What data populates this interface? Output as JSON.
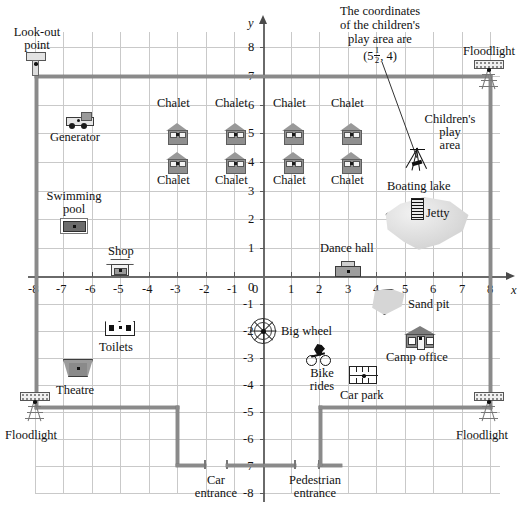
{
  "axes": {
    "x_name": "x",
    "y_name": "y",
    "x_ticks": [
      "-8",
      "-7",
      "-6",
      "-5",
      "-4",
      "-3",
      "-2",
      "-1",
      "0",
      "1",
      "2",
      "3",
      "4",
      "5",
      "6",
      "7",
      "8"
    ],
    "y_ticks": [
      "8",
      "7",
      "6",
      "5",
      "4",
      "3",
      "2",
      "1",
      "0",
      "-1",
      "-2",
      "-3",
      "-4",
      "-5",
      "-6",
      "-7",
      "-8"
    ],
    "x_range": [
      -8,
      8
    ],
    "y_range": [
      -8,
      8
    ]
  },
  "callout": {
    "line1": "The coordinates",
    "line2": "of the children's",
    "line3": "play area are",
    "open_paren": "(5",
    "frac_num": "1",
    "frac_den": "2",
    "close": ", 4)"
  },
  "places": [
    {
      "id": "look-out-point",
      "label": "Look-out\npoint",
      "label_lines": [
        "Look-out",
        "point"
      ],
      "coord": [
        -8,
        7
      ]
    },
    {
      "id": "generator",
      "label": "Generator",
      "coord": [
        -6.3,
        5.6
      ]
    },
    {
      "id": "swimming-pool",
      "label": "Swimming\npool",
      "label_lines": [
        "Swimming",
        "pool"
      ],
      "coord": [
        -6.3,
        2.2
      ]
    },
    {
      "id": "shop",
      "label": "Shop",
      "coord": [
        -5,
        0.3
      ]
    },
    {
      "id": "toilets",
      "label": "Toilets",
      "coord": [
        -5,
        -2
      ]
    },
    {
      "id": "theatre",
      "label": "Theatre",
      "coord": [
        -6.5,
        -3.3
      ]
    },
    {
      "id": "floodlight-bottom-left",
      "label": "Floodlight",
      "coord": [
        -8,
        -5
      ]
    },
    {
      "id": "floodlight-top-right",
      "label": "Floodlight",
      "coord": [
        8,
        7
      ]
    },
    {
      "id": "floodlight-bottom-right",
      "label": "Floodlight",
      "coord": [
        8,
        -5
      ]
    },
    {
      "id": "chalet-1",
      "label": "Chalet",
      "coord": [
        -2,
        5
      ]
    },
    {
      "id": "chalet-2",
      "label": "Chalet",
      "coord": [
        -0.5,
        5
      ]
    },
    {
      "id": "chalet-3",
      "label": "Chalet",
      "coord": [
        1,
        5
      ]
    },
    {
      "id": "chalet-4",
      "label": "Chalet",
      "coord": [
        2.5,
        5
      ]
    },
    {
      "id": "chalet-5",
      "label": "Chalet",
      "coord": [
        -2,
        4
      ]
    },
    {
      "id": "chalet-6",
      "label": "Chalet",
      "coord": [
        -0.5,
        4
      ]
    },
    {
      "id": "chalet-7",
      "label": "Chalet",
      "coord": [
        1,
        4
      ]
    },
    {
      "id": "chalet-8",
      "label": "Chalet",
      "coord": [
        2.5,
        4
      ]
    },
    {
      "id": "childrens-play-area",
      "label": "Children's\nplay\narea",
      "label_lines": [
        "Children's",
        "play",
        "area"
      ],
      "coord": [
        5.5,
        4
      ]
    },
    {
      "id": "boating-lake",
      "label": "Boating lake",
      "coord": [
        5,
        2
      ]
    },
    {
      "id": "jetty",
      "label": "Jetty",
      "coord": [
        5.5,
        2.3
      ]
    },
    {
      "id": "dance-hall",
      "label": "Dance hall",
      "coord": [
        3,
        0
      ]
    },
    {
      "id": "sand-pit",
      "label": "Sand pit",
      "coord": [
        4.5,
        -1
      ]
    },
    {
      "id": "big-wheel",
      "label": "Big wheel",
      "coord": [
        0,
        -2
      ]
    },
    {
      "id": "bike-rides",
      "label": "Bike\nrides",
      "label_lines": [
        "Bike",
        "rides"
      ],
      "coord": [
        2,
        -3
      ]
    },
    {
      "id": "camp-office",
      "label": "Camp office",
      "coord": [
        5.5,
        -2.5
      ]
    },
    {
      "id": "car-park",
      "label": "Car park",
      "coord": [
        3.5,
        -3.5
      ]
    },
    {
      "id": "car-entrance",
      "label": "Car\nentrance",
      "label_lines": [
        "Car",
        "entrance"
      ],
      "coord": [
        -1.5,
        -7
      ]
    },
    {
      "id": "pedestrian-entrance",
      "label": "Pedestrian\nentrance",
      "label_lines": [
        "Pedestrian",
        "entrance"
      ],
      "coord": [
        1.2,
        -7
      ]
    }
  ],
  "colors": {
    "grid": "#c9c9c9",
    "axis": "#6a6a6a",
    "fence": "#8a8a8a",
    "text": "#111111",
    "icon_fill": "#8f8f8f",
    "lake": "#dedede"
  }
}
